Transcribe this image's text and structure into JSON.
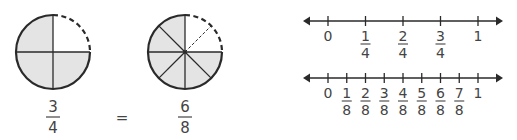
{
  "colors": {
    "stroke": "#2a2a2a",
    "shade": "#e4e4e4",
    "text": "#444444",
    "background": "#ffffff"
  },
  "circles": [
    {
      "name": "fourths",
      "parts": 4,
      "shaded_parts": 3,
      "unshaded_dashed": true,
      "fraction": {
        "numerator": "3",
        "denominator": "4"
      }
    },
    {
      "name": "eighths",
      "parts": 8,
      "shaded_parts": 6,
      "unshaded_dashed": true,
      "fraction": {
        "numerator": "6",
        "denominator": "8"
      }
    }
  ],
  "equals_sign": "=",
  "number_lines": [
    {
      "name": "fourths-line",
      "min": 0,
      "max": 1,
      "divisions": 4,
      "labels": [
        {
          "whole": "0"
        },
        {
          "numerator": "1",
          "denominator": "4"
        },
        {
          "numerator": "2",
          "denominator": "4"
        },
        {
          "numerator": "3",
          "denominator": "4"
        },
        {
          "whole": "1"
        }
      ]
    },
    {
      "name": "eighths-line",
      "min": 0,
      "max": 1,
      "divisions": 8,
      "labels": [
        {
          "whole": "0"
        },
        {
          "numerator": "1",
          "denominator": "8"
        },
        {
          "numerator": "2",
          "denominator": "8"
        },
        {
          "numerator": "3",
          "denominator": "8"
        },
        {
          "numerator": "4",
          "denominator": "8"
        },
        {
          "numerator": "5",
          "denominator": "8"
        },
        {
          "numerator": "6",
          "denominator": "8"
        },
        {
          "numerator": "7",
          "denominator": "8"
        },
        {
          "whole": "1"
        }
      ]
    }
  ]
}
